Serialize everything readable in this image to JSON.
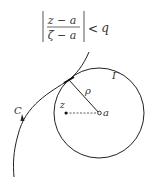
{
  "formula": {
    "numerator": "z − a",
    "denominator": "ζ − a",
    "relation": "<",
    "rhs": "q"
  },
  "labels": {
    "curve": "C",
    "circle": "Γ",
    "radius": "ρ",
    "point_z": "z",
    "center": "a"
  },
  "colors": {
    "stroke": "#222222",
    "text": "#333333",
    "background": "#ffffff"
  }
}
